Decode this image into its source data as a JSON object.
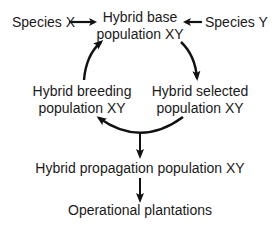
{
  "diagram": {
    "type": "flowchart",
    "nodes": {
      "species_x": {
        "label": "Species X"
      },
      "species_y": {
        "label": "Species Y"
      },
      "hybrid_base": {
        "line1": "Hybrid base",
        "line2": "population XY"
      },
      "hybrid_breeding": {
        "line1": "Hybrid breeding",
        "line2": "population XY"
      },
      "hybrid_selected": {
        "line1": "Hybrid selected",
        "line2": "population XY"
      },
      "hybrid_propagation": {
        "label": "Hybrid propagation population XY"
      },
      "operational": {
        "label": "Operational plantations"
      }
    },
    "edges": [
      {
        "from": "Species X",
        "to": "Hybrid base population XY"
      },
      {
        "from": "Species Y",
        "to": "Hybrid base population XY"
      },
      {
        "from": "Hybrid base population XY",
        "to": "Hybrid selected population XY"
      },
      {
        "from": "Hybrid selected population XY",
        "to": "Hybrid breeding population XY"
      },
      {
        "from": "Hybrid breeding population XY",
        "to": "Hybrid base population XY"
      },
      {
        "from": "Hybrid selected/breeding cycle",
        "to": "Hybrid propagation population XY"
      },
      {
        "from": "Hybrid propagation population XY",
        "to": "Operational plantations"
      }
    ],
    "colors": {
      "text": "#1a1a1a",
      "arrow": "#111111",
      "background": "#ffffff"
    }
  }
}
